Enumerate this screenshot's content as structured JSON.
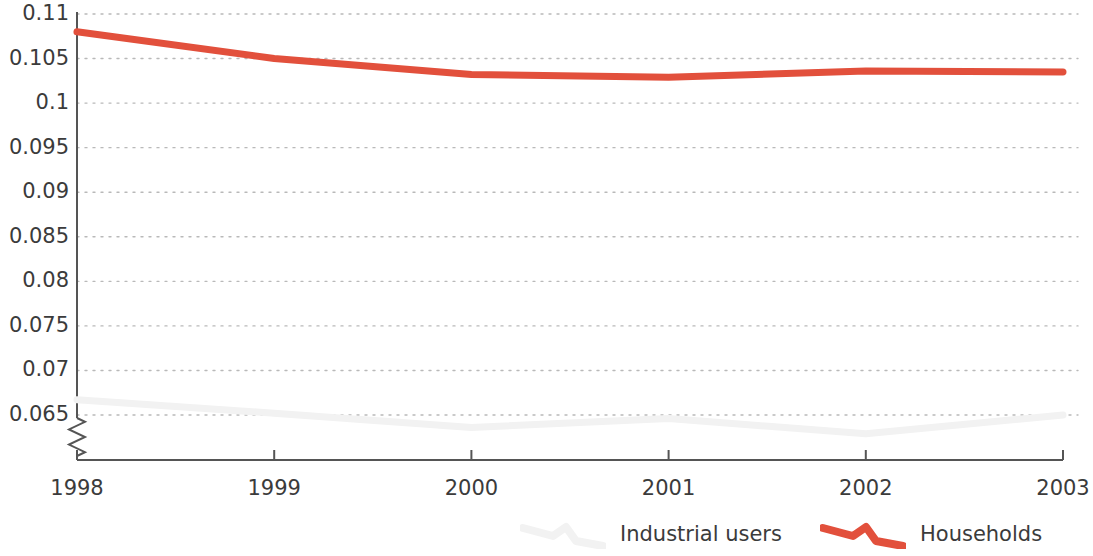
{
  "chart_data": {
    "type": "line",
    "title": "",
    "subtitle": "",
    "xlabel": "",
    "ylabel": "",
    "categories": [
      "1998",
      "1999",
      "2000",
      "2001",
      "2002",
      "2003"
    ],
    "x": [
      1998,
      1999,
      2000,
      2001,
      2002,
      2003
    ],
    "xlim": [
      1998,
      2003
    ],
    "ylim": [
      0.065,
      0.11
    ],
    "y_axis_break": true,
    "y_axis_break_note": "zigzag break on vertical axis below 0.065",
    "grid": true,
    "grid_style": "dotted-horizontal",
    "legend_position": "bottom-right",
    "yticks": [
      "0.065",
      "0.07",
      "0.075",
      "0.08",
      "0.085",
      "0.09",
      "0.095",
      "0.1",
      "0.105",
      "0.11"
    ],
    "ytick_values": [
      0.065,
      0.07,
      0.075,
      0.08,
      0.085,
      0.09,
      0.095,
      0.1,
      0.105,
      0.11
    ],
    "series": [
      {
        "name": "Industrial users",
        "color": "#f2f2f2",
        "values": [
          0.0667,
          0.0652,
          0.0636,
          0.0646,
          0.0629,
          0.065
        ]
      },
      {
        "name": "Households",
        "color": "#e2503c",
        "values": [
          0.108,
          0.105,
          0.1032,
          0.1029,
          0.1036,
          0.1035
        ]
      }
    ]
  },
  "legend": {
    "items": [
      {
        "label": "Industrial users",
        "marker": "zigzag-line-marker",
        "color": "#f2f2f2"
      },
      {
        "label": "Households",
        "marker": "zigzag-line-marker",
        "color": "#e2503c"
      }
    ]
  },
  "axes": {
    "axis_color": "#555555",
    "grid_color": "#b9b9b9",
    "tick_color": "#555555"
  }
}
